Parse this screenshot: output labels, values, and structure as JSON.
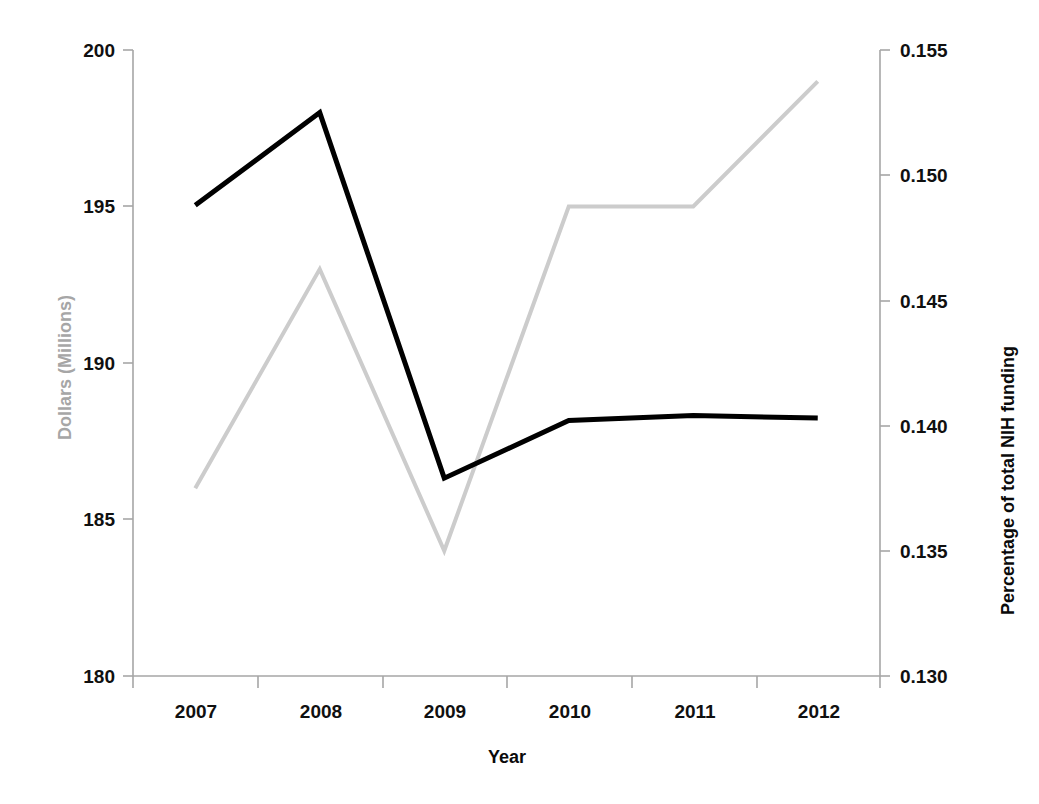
{
  "chart_data": {
    "type": "line",
    "title": "",
    "subtitle": "",
    "xlabel": "Year",
    "categories": [
      "2007",
      "2008",
      "2009",
      "2010",
      "2011",
      "2012"
    ],
    "grid": false,
    "legend": "none",
    "axes": {
      "x": {
        "label": "Year",
        "tick_labels": [
          "2007",
          "2008",
          "2009",
          "2010",
          "2011",
          "2012"
        ],
        "type": "category"
      },
      "y_left": {
        "label": "Dollars (Millions)",
        "ylim": [
          180,
          200
        ],
        "tick_step": 5,
        "tick_labels": [
          "180",
          "185",
          "190",
          "195",
          "200"
        ],
        "color": "#bfbfbf"
      },
      "y_right": {
        "label": "Percentage of total NIH funding",
        "ylim": [
          0.13,
          0.155
        ],
        "tick_step": 0.005,
        "tick_labels": [
          "0.130",
          "0.135",
          "0.140",
          "0.145",
          "0.150",
          "0.155"
        ],
        "color": "#000000"
      }
    },
    "series": [
      {
        "name": "Dollars (Millions)",
        "axis": "y_left",
        "color": "#cccccc",
        "line_width": 4,
        "values": [
          186,
          193,
          184,
          195,
          195,
          199
        ]
      },
      {
        "name": "Percentage of total NIH funding",
        "axis": "y_right",
        "color": "#000000",
        "line_width": 5,
        "values": [
          0.1488,
          0.1525,
          0.1379,
          0.1402,
          0.1404,
          0.1403
        ]
      }
    ]
  },
  "figure": {
    "background": "#ffffff",
    "axis_line_color": "#a6a6a6"
  }
}
